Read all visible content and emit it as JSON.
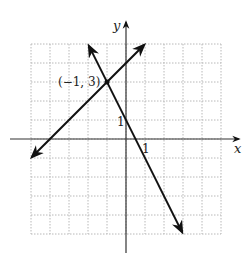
{
  "figure": {
    "type": "coordinate-plane",
    "axes": {
      "x_label": "x",
      "y_label": "y",
      "x_tick_label": "1",
      "y_tick_label": "1",
      "x_range": [
        -5,
        5
      ],
      "y_range": [
        -5,
        5
      ]
    },
    "grid": {
      "on": true,
      "style": "dotted",
      "color": "#b8b8b8"
    },
    "lines": [
      {
        "name": "line-1",
        "equation": "y = x + 4",
        "slope": 1,
        "intercept": 4,
        "x_from": -4.95,
        "x_to": 0.95
      },
      {
        "name": "line-2",
        "equation": "y = -2x + 1",
        "slope": -2,
        "intercept": 1,
        "x_from": -1.95,
        "x_to": 2.95
      }
    ],
    "intersection": {
      "x": -1,
      "y": 3,
      "label": "(−1, 3)"
    },
    "colors": {
      "line": "#111111",
      "axis": "#333333",
      "grid": "#b8b8b8"
    }
  }
}
